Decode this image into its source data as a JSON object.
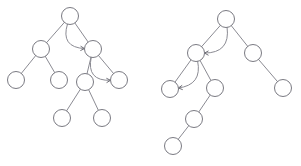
{
  "figure": {
    "name": "binary-tree-pair-diagram",
    "type": "diagram",
    "width": 301,
    "height": 166,
    "background_color": "#ffffff",
    "node_stroke_color": "#7a7a82",
    "node_fill_color": "#ffffff",
    "edge_color": "#8b8b93",
    "arc_color": "#8b8b93",
    "node_radius": 8.5,
    "stroke_width": 1
  },
  "trees": [
    {
      "id": "left-tree",
      "name": "left-binary-tree",
      "nodes": [
        {
          "id": "L0",
          "name": "left-tree-root-node",
          "cx": 70,
          "cy": 16,
          "r": 8.5,
          "label": ""
        },
        {
          "id": "L1",
          "name": "left-tree-node-l1",
          "cx": 41,
          "cy": 49,
          "r": 8.5,
          "label": ""
        },
        {
          "id": "L2",
          "name": "left-tree-node-r1",
          "cx": 93,
          "cy": 49,
          "r": 8.5,
          "label": ""
        },
        {
          "id": "L3",
          "name": "left-tree-leaf-ll",
          "cx": 16,
          "cy": 80,
          "r": 8.5,
          "label": ""
        },
        {
          "id": "L4",
          "name": "left-tree-leaf-lr",
          "cx": 59,
          "cy": 80,
          "r": 8.5,
          "label": ""
        },
        {
          "id": "L5",
          "name": "left-tree-node-rl",
          "cx": 85,
          "cy": 82,
          "r": 8.5,
          "label": ""
        },
        {
          "id": "L6",
          "name": "left-tree-leaf-rr",
          "cx": 119,
          "cy": 80,
          "r": 8.5,
          "label": ""
        },
        {
          "id": "L7",
          "name": "left-tree-leaf-rll",
          "cx": 62,
          "cy": 118,
          "r": 8.5,
          "label": ""
        },
        {
          "id": "L8",
          "name": "left-tree-leaf-rlr",
          "cx": 102,
          "cy": 118,
          "r": 8.5,
          "label": ""
        }
      ],
      "edges": [
        {
          "name": "left-edge-root-to-l1",
          "from": "L0",
          "to": "L1"
        },
        {
          "name": "left-edge-root-to-r1",
          "from": "L0",
          "to": "L2"
        },
        {
          "name": "left-edge-l1-to-ll",
          "from": "L1",
          "to": "L3"
        },
        {
          "name": "left-edge-l1-to-lr",
          "from": "L1",
          "to": "L4"
        },
        {
          "name": "left-edge-r1-to-rl",
          "from": "L2",
          "to": "L5"
        },
        {
          "name": "left-edge-r1-to-rr",
          "from": "L2",
          "to": "L6"
        },
        {
          "name": "left-edge-rl-to-rll",
          "from": "L5",
          "to": "L7"
        },
        {
          "name": "left-edge-rl-to-rlr",
          "from": "L5",
          "to": "L8"
        }
      ],
      "arcs": [
        {
          "name": "left-arc-root-to-r1",
          "from": "L0",
          "to": "L2",
          "bulge": 26,
          "direction": "right",
          "arrowhead": true
        },
        {
          "name": "left-arc-r1-to-rr",
          "from": "L2",
          "to": "L6",
          "bulge": 26,
          "direction": "right",
          "arrowhead": true
        }
      ]
    },
    {
      "id": "right-tree",
      "name": "right-binary-tree",
      "nodes": [
        {
          "id": "R0",
          "name": "right-tree-root-node",
          "cx": 226,
          "cy": 19,
          "r": 8.5,
          "label": ""
        },
        {
          "id": "R1",
          "name": "right-tree-node-l1",
          "cx": 196,
          "cy": 53,
          "r": 8.5,
          "label": ""
        },
        {
          "id": "R2",
          "name": "right-tree-node-r1",
          "cx": 253,
          "cy": 53,
          "r": 8.5,
          "label": ""
        },
        {
          "id": "R3",
          "name": "right-tree-leaf-ll",
          "cx": 170,
          "cy": 89,
          "r": 8.5,
          "label": ""
        },
        {
          "id": "R4",
          "name": "right-tree-node-lr",
          "cx": 215,
          "cy": 88,
          "r": 8.5,
          "label": ""
        },
        {
          "id": "R5",
          "name": "right-tree-leaf-rr",
          "cx": 283,
          "cy": 88,
          "r": 8.5,
          "label": ""
        },
        {
          "id": "R6",
          "name": "right-tree-node-lrl",
          "cx": 194,
          "cy": 119,
          "r": 8.5,
          "label": ""
        },
        {
          "id": "R7",
          "name": "right-tree-leaf-lrll",
          "cx": 173,
          "cy": 146,
          "r": 8.5,
          "label": ""
        }
      ],
      "edges": [
        {
          "name": "right-edge-root-to-l1",
          "from": "R0",
          "to": "R1"
        },
        {
          "name": "right-edge-root-to-r1",
          "from": "R0",
          "to": "R2"
        },
        {
          "name": "right-edge-l1-to-ll",
          "from": "R1",
          "to": "R3"
        },
        {
          "name": "right-edge-l1-to-lr",
          "from": "R1",
          "to": "R4"
        },
        {
          "name": "right-edge-r1-to-rr",
          "from": "R2",
          "to": "R5"
        },
        {
          "name": "right-edge-lr-to-lrl",
          "from": "R4",
          "to": "R6"
        },
        {
          "name": "right-edge-lrl-to-lrll",
          "from": "R6",
          "to": "R7"
        }
      ],
      "arcs": [
        {
          "name": "right-arc-root-to-l1",
          "from": "R0",
          "to": "R1",
          "bulge": 26,
          "direction": "left",
          "arrowhead": true
        },
        {
          "name": "right-arc-l1-to-ll",
          "from": "R1",
          "to": "R3",
          "bulge": 24,
          "direction": "left",
          "arrowhead": true
        }
      ]
    }
  ]
}
